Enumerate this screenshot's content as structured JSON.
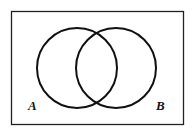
{
  "diagram": {
    "type": "venn",
    "universe": {
      "x": 11,
      "y": 11,
      "width": 173,
      "height": 114,
      "stroke": "#222222"
    },
    "sets": [
      {
        "label": "A",
        "cx": 77,
        "cy": 68,
        "r": 40,
        "label_x": 28,
        "label_y": 110
      },
      {
        "label": "B",
        "cx": 116,
        "cy": 68,
        "r": 40,
        "label_x": 156,
        "label_y": 110
      }
    ],
    "stroke_color": "#111111"
  }
}
